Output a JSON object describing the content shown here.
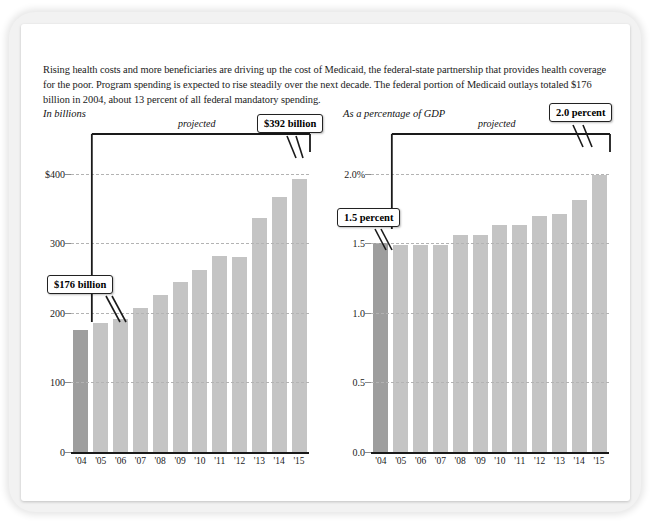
{
  "intro": {
    "text": "Rising health costs and more beneficiaries are driving up the cost of Medicaid, the federal-state partnership that provides health coverage for the poor. Program spending is expected to rise steadily over the next decade. The federal portion of Medicaid outlays totaled $176 billion in 2004, about 13 percent of all federal mandatory spending."
  },
  "left_panel": {
    "title": "In billions",
    "projected_label": "projected",
    "callout_start": "$176 billion",
    "callout_end": "$392 billion"
  },
  "right_panel": {
    "title": "As a percentage of GDP",
    "projected_label": "projected",
    "callout_start": "1.5 percent",
    "callout_end": "2.0 percent"
  },
  "colors": {
    "bar_actual": "#9e9e9e",
    "bar_projected": "#c4c4c4",
    "gridline": "#b3b3b3",
    "axis": "#1a1a1a",
    "frame": "#f2f2f2"
  },
  "chart_data": [
    {
      "type": "bar",
      "title": "In billions",
      "subtitle": "Federal Medicaid outlays",
      "xlabel": "",
      "ylabel": "In billions",
      "categories": [
        "'04",
        "'05",
        "'06",
        "'07",
        "'08",
        "'09",
        "'10",
        "'11",
        "'12",
        "'13",
        "'14",
        "'15"
      ],
      "values": [
        176,
        186,
        192,
        207,
        226,
        245,
        262,
        282,
        281,
        337,
        367,
        392
      ],
      "ylim": [
        0,
        430
      ],
      "yticks": [
        0,
        100,
        200,
        300,
        400
      ],
      "ytick_labels": [
        "0",
        "100",
        "200",
        "300",
        "$400"
      ],
      "grid": true,
      "legend": "none",
      "annotations": [
        {
          "label": "$176 billion",
          "category": "'04",
          "value": 176
        },
        {
          "label": "$392 billion",
          "category": "'15",
          "value": 392
        },
        {
          "label": "projected",
          "span": [
            "'05",
            "'15"
          ]
        }
      ],
      "series_colors": [
        "#9e9e9e",
        "#c4c4c4",
        "#c4c4c4",
        "#c4c4c4",
        "#c4c4c4",
        "#c4c4c4",
        "#c4c4c4",
        "#c4c4c4",
        "#c4c4c4",
        "#c4c4c4",
        "#c4c4c4",
        "#c4c4c4"
      ]
    },
    {
      "type": "bar",
      "title": "As a percentage of GDP",
      "subtitle": "Federal Medicaid outlays as share of GDP",
      "xlabel": "",
      "ylabel": "As a percentage of GDP",
      "categories": [
        "'04",
        "'05",
        "'06",
        "'07",
        "'08",
        "'09",
        "'10",
        "'11",
        "'12",
        "'13",
        "'14",
        "'15"
      ],
      "values": [
        1.5,
        1.49,
        1.49,
        1.49,
        1.56,
        1.56,
        1.63,
        1.63,
        1.7,
        1.71,
        1.81,
        1.99
      ],
      "ylim": [
        0.0,
        2.15
      ],
      "yticks": [
        0.0,
        0.5,
        1.0,
        1.5,
        2.0
      ],
      "ytick_labels": [
        "0.0",
        "0.5",
        "1.0",
        "1.5",
        "2.0%"
      ],
      "grid": true,
      "legend": "none",
      "annotations": [
        {
          "label": "1.5 percent",
          "category": "'04",
          "value": 1.5
        },
        {
          "label": "2.0 percent",
          "category": "'15",
          "value": 2.0
        },
        {
          "label": "projected",
          "span": [
            "'05",
            "'15"
          ]
        }
      ],
      "series_colors": [
        "#9e9e9e",
        "#c4c4c4",
        "#c4c4c4",
        "#c4c4c4",
        "#c4c4c4",
        "#c4c4c4",
        "#c4c4c4",
        "#c4c4c4",
        "#c4c4c4",
        "#c4c4c4",
        "#c4c4c4",
        "#c4c4c4"
      ]
    }
  ]
}
